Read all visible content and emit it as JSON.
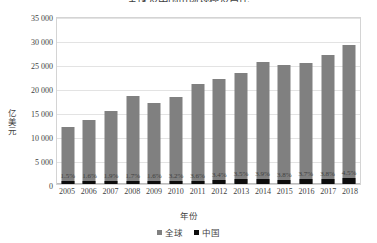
{
  "chart_data": {
    "type": "bar",
    "title": "全球及中国市场规模及占比",
    "xlabel": "年份",
    "ylabel": "亿美元",
    "categories": [
      "2005",
      "2006",
      "2007",
      "2008",
      "2009",
      "2010",
      "2011",
      "2012",
      "2013",
      "2014",
      "2015",
      "2016",
      "2017",
      "2018"
    ],
    "ylim": [
      0,
      35000
    ],
    "yticks": [
      "0",
      "5 000",
      "10 000",
      "15 000",
      "20 000",
      "25 000",
      "30 000",
      "35 000"
    ],
    "ytick_values": [
      0,
      5000,
      10000,
      15000,
      20000,
      25000,
      30000,
      35000
    ],
    "grid": true,
    "legend_position": "bottom",
    "series": [
      {
        "name": "全球",
        "color": "#808080",
        "values": [
          11800,
          13300,
          15200,
          18300,
          16800,
          18100,
          20800,
          21900,
          23100,
          25400,
          24800,
          25300,
          26900,
          29000
        ]
      },
      {
        "name": "中国",
        "color": "#0d0d0d",
        "values": [
          177,
          213,
          289,
          311,
          269,
          579,
          666,
          789,
          991,
          942,
          936,
          995,
          1022,
          1305
        ],
        "data_labels": [
          "1.5%",
          "1.6%",
          "1.9%",
          "1.7%",
          "1.6%",
          "3.2%",
          "3.6%",
          "3.6%",
          "3.4%",
          "3.5%",
          "3.9%",
          "3.8%",
          "3.7%",
          "3.8%",
          "4.5%"
        ]
      }
    ],
    "china_share_labels": [
      "1.5%",
      "1.6%",
      "1.9%",
      "1.7%",
      "1.6%",
      "3.2%",
      "3.6%",
      "3.4%",
      "3.5%",
      "3.9%",
      "3.8%",
      "3.7%",
      "3.8%",
      "4.5%"
    ]
  },
  "legend": {
    "items": [
      {
        "label": "全球",
        "color": "#808080"
      },
      {
        "label": "中国",
        "color": "#0d0d0d"
      }
    ]
  }
}
